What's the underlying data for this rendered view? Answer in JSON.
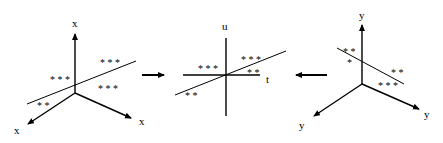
{
  "left_panel": {
    "axis_labels": {
      "up": "x",
      "left": "x",
      "right": "x"
    },
    "stars": {
      "upper_right": "* * *",
      "mid_left": "* * *",
      "lower_right": "* * *",
      "bottom_left": "* *"
    }
  },
  "middle_panel": {
    "axis_labels": {
      "vertical": "u",
      "horizontal": "t"
    },
    "stars": {
      "upper_right": "* * *",
      "left": "* * *",
      "right_below": "* *",
      "bottom_left": "* *"
    }
  },
  "right_panel": {
    "axis_labels": {
      "up": "y",
      "left": "y",
      "right": "y"
    },
    "stars": {
      "upper_left": "* *",
      "left_single": "*",
      "right": "* *",
      "lower_right": "* * *"
    }
  },
  "arrows": {
    "left_to_middle": "right-arrow",
    "right_to_middle": "left-arrow"
  }
}
